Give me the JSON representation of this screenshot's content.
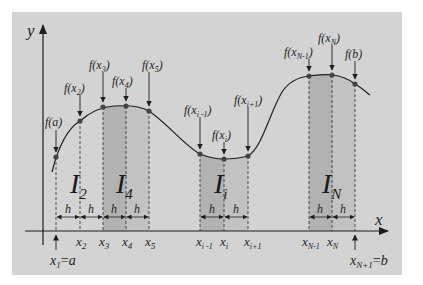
{
  "diagram": {
    "colors": {
      "background": "#d3d3d3",
      "shade_dark": "#b4b4b4",
      "shade_light": "#c4c4c4",
      "line": "#1e1e1e",
      "point": "#444444"
    },
    "axes": {
      "y_label": "y",
      "x_label": "x"
    },
    "function_labels": {
      "fa": "f(a)",
      "fx2": "f(x2)",
      "fx3": "f(x3)",
      "fx4": "f(x4)",
      "fx5": "f(x5)",
      "fxim1": "f(xi-1)",
      "fxi": "f(xi)",
      "fxip1": "f(xi+1)",
      "fxNm1": "f(xN-1)",
      "fxN": "f(xN)",
      "fb": "f(b)"
    },
    "integral_labels": [
      "I2",
      "I4",
      "Ii",
      "IN"
    ],
    "step_label": "h",
    "x_ticks": [
      "x1 = a",
      "x2",
      "x3",
      "x4",
      "x5",
      "xi-1",
      "xi",
      "xi+1",
      "xN-1",
      "xN",
      "xN+1 = b"
    ],
    "text": {
      "f": "f(",
      "close": ")",
      "a": "a",
      "b": "b",
      "x": "x",
      "I": "I",
      "sub2": "2",
      "sub3": "3",
      "sub4": "4",
      "sub5": "5",
      "sub1": "1",
      "subi": "i",
      "subN": "N",
      "subim1": "i -1",
      "subip1": "i+1",
      "subNm1": "N-1",
      "subNp1": "N+1",
      "eq": "=",
      "h": "h"
    }
  }
}
